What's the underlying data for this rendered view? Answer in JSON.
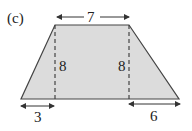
{
  "figure": {
    "label": "(c)",
    "shape": "trapezoid",
    "fill_color": "#dcdcdc",
    "stroke_color": "#333333",
    "dimensions": {
      "top": "7",
      "left_height": "8",
      "right_height": "8",
      "bottom_left_offset": "3",
      "bottom_right_offset": "6"
    }
  }
}
